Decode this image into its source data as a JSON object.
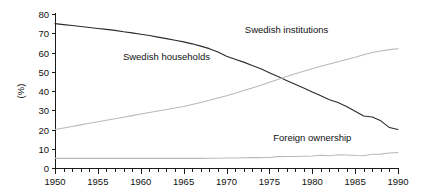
{
  "chart_data": {
    "type": "line",
    "title": "",
    "subtitle": "",
    "xlabel": "",
    "ylabel": "(%)",
    "xlim": [
      1950,
      1990
    ],
    "ylim": [
      0,
      80
    ],
    "grid": false,
    "legend_position": "inline-annotations",
    "y_ticks": [
      "0",
      "10",
      "20",
      "30",
      "40",
      "50",
      "60",
      "70",
      "80"
    ],
    "y_tick_values": [
      0,
      10,
      20,
      30,
      40,
      50,
      60,
      70,
      80
    ],
    "x_ticks": [
      "1950",
      "1955",
      "1960",
      "1965",
      "1970",
      "1975",
      "1980",
      "1985",
      "1990"
    ],
    "x_tick_values": [
      1950,
      1955,
      1960,
      1965,
      1970,
      1975,
      1980,
      1985,
      1990
    ],
    "x_minor_tick_interval": 1,
    "x": [
      1950,
      1951,
      1952,
      1953,
      1954,
      1955,
      1956,
      1957,
      1958,
      1959,
      1960,
      1961,
      1962,
      1963,
      1964,
      1965,
      1966,
      1967,
      1968,
      1969,
      1970,
      1971,
      1972,
      1973,
      1974,
      1975,
      1976,
      1977,
      1978,
      1979,
      1980,
      1981,
      1982,
      1983,
      1984,
      1985,
      1986,
      1987,
      1988,
      1989,
      1990
    ],
    "series": [
      {
        "name": "Swedish households",
        "color": "#2b2b2b",
        "label_x": 1963,
        "label_y": 56,
        "values": [
          75,
          74.5,
          74,
          73.5,
          73,
          72.5,
          72,
          71.5,
          70.8,
          70.2,
          69.5,
          68.8,
          68,
          67.2,
          66.4,
          65.5,
          64.5,
          63.3,
          62.0,
          60.2,
          58.0,
          56.5,
          55.0,
          53.2,
          51.5,
          49.5,
          47.5,
          45.5,
          43.5,
          41.5,
          39.5,
          37.5,
          35.5,
          34.0,
          32.0,
          29.5,
          27.0,
          26.5,
          24.5,
          21.0,
          20.0
        ]
      },
      {
        "name": "Swedish institutions",
        "color": "#b9b9b9",
        "label_x": 1977,
        "label_y": 70,
        "values": [
          20,
          20.8,
          21.6,
          22.4,
          23.2,
          24.0,
          24.8,
          25.6,
          26.4,
          27.2,
          28.0,
          28.8,
          29.6,
          30.4,
          31.2,
          32.0,
          33.0,
          34.0,
          35.2,
          36.4,
          37.5,
          38.8,
          40.2,
          41.6,
          43.0,
          44.5,
          46.0,
          47.5,
          49.0,
          50.3,
          51.5,
          52.8,
          54.0,
          55.2,
          56.4,
          57.5,
          58.8,
          60.0,
          60.8,
          61.5,
          62.0
        ]
      },
      {
        "name": "Foreign ownership",
        "color": "#b9b9b9",
        "label_x": 1980,
        "label_y": 14,
        "values": [
          5.0,
          5.0,
          5.0,
          5.0,
          5.0,
          5.0,
          5.0,
          5.0,
          5.0,
          5.0,
          5.0,
          5.0,
          5.0,
          5.0,
          5.0,
          5.0,
          5.0,
          5.0,
          5.1,
          5.1,
          5.2,
          5.2,
          5.3,
          5.4,
          5.4,
          5.5,
          5.9,
          6.0,
          6.0,
          6.1,
          6.2,
          6.6,
          6.4,
          6.9,
          6.7,
          6.5,
          6.4,
          7.1,
          7.2,
          7.8,
          8.0
        ]
      }
    ],
    "annotations": [
      {
        "text": "Swedish households",
        "x": 1963,
        "y": 56
      },
      {
        "text": "Swedish institutions",
        "x": 1977,
        "y": 70
      },
      {
        "text": "Foreign ownership",
        "x": 1980,
        "y": 14
      }
    ]
  }
}
